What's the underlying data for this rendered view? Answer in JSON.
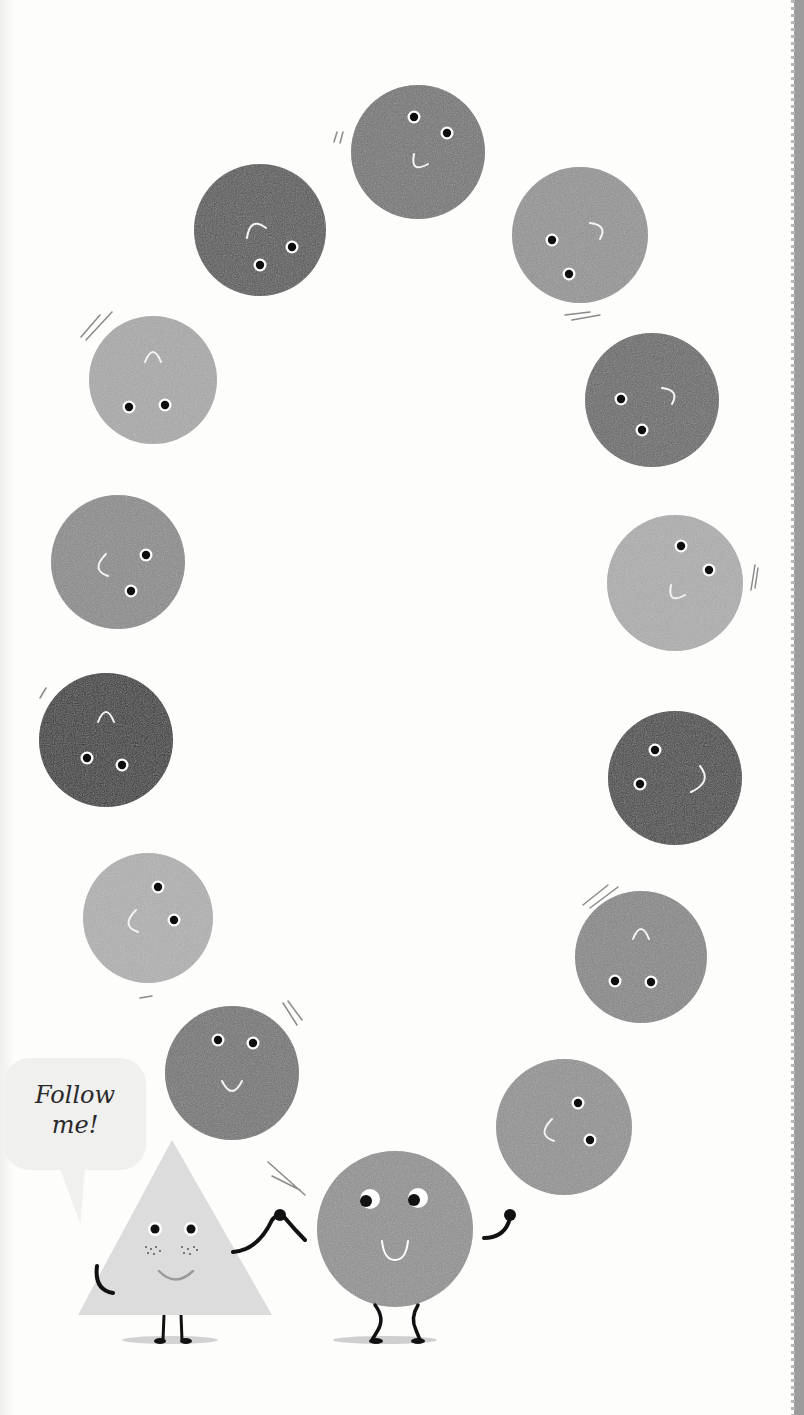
{
  "illustration": {
    "background_color": "#fdfdfc",
    "speech_bubble": {
      "line1": "Follow",
      "line2": "me!"
    },
    "circles": [
      {
        "id": "top",
        "cx": 418,
        "cy": 152,
        "r": 67,
        "fill": "#6e6e6e",
        "eyes": [
          [
            414,
            117
          ],
          [
            447,
            133
          ]
        ],
        "mouth": "smile-tilt"
      },
      {
        "id": "upper-left-dark",
        "cx": 260,
        "cy": 230,
        "r": 66,
        "fill": "#505050",
        "eyes": [
          [
            260,
            265
          ],
          [
            292,
            247
          ]
        ],
        "mouth": "frown-upper"
      },
      {
        "id": "upper-right",
        "cx": 580,
        "cy": 235,
        "r": 68,
        "fill": "#8d8d8d",
        "eyes": [
          [
            552,
            240
          ],
          [
            569,
            274
          ]
        ],
        "mouth": "hook-right"
      },
      {
        "id": "left-light",
        "cx": 153,
        "cy": 380,
        "r": 64,
        "fill": "#a2a2a2",
        "eyes": [
          [
            129,
            407
          ],
          [
            165,
            405
          ]
        ],
        "mouth": "arch-top"
      },
      {
        "id": "right-dark",
        "cx": 652,
        "cy": 400,
        "r": 67,
        "fill": "#626262",
        "eyes": [
          [
            621,
            399
          ],
          [
            642,
            430
          ]
        ],
        "mouth": "hook-right"
      },
      {
        "id": "left-medium",
        "cx": 118,
        "cy": 562,
        "r": 67,
        "fill": "#848484",
        "eyes": [
          [
            146,
            555
          ],
          [
            131,
            591
          ]
        ],
        "mouth": "c-left"
      },
      {
        "id": "right-light",
        "cx": 675,
        "cy": 583,
        "r": 68,
        "fill": "#a6a6a6",
        "eyes": [
          [
            681,
            546
          ],
          [
            709,
            570
          ]
        ],
        "mouth": "smile-tilt"
      },
      {
        "id": "left-black",
        "cx": 106,
        "cy": 740,
        "r": 67,
        "fill": "#2b2b2b",
        "eyes": [
          [
            87,
            758
          ],
          [
            122,
            765
          ]
        ],
        "mouth": "arch-top"
      },
      {
        "id": "right-darker",
        "cx": 675,
        "cy": 778,
        "r": 67,
        "fill": "#3d3d3d",
        "eyes": [
          [
            655,
            750
          ],
          [
            640,
            784
          ]
        ],
        "mouth": "hook-right-low"
      },
      {
        "id": "left-dotted",
        "cx": 148,
        "cy": 918,
        "r": 65,
        "fill": "#a9a9a9",
        "eyes": [
          [
            158,
            887
          ],
          [
            174,
            920
          ]
        ],
        "mouth": "c-left"
      },
      {
        "id": "right-medium",
        "cx": 641,
        "cy": 957,
        "r": 66,
        "fill": "#808080",
        "eyes": [
          [
            615,
            981
          ],
          [
            651,
            982
          ]
        ],
        "mouth": "arch-top"
      },
      {
        "id": "lower-left",
        "cx": 232,
        "cy": 1073,
        "r": 67,
        "fill": "#6d6d6d",
        "eyes": [
          [
            218,
            1040
          ],
          [
            253,
            1043
          ]
        ],
        "mouth": "smile"
      },
      {
        "id": "lower-right",
        "cx": 564,
        "cy": 1127,
        "r": 68,
        "fill": "#8b8b8b",
        "eyes": [
          [
            578,
            1103
          ],
          [
            590,
            1140
          ]
        ],
        "mouth": "c-left"
      }
    ],
    "main_circle": {
      "cx": 395,
      "cy": 1229,
      "r": 78,
      "fill": "#8a8a8a"
    },
    "triangle": {
      "fill": "#dcdcdc"
    }
  }
}
